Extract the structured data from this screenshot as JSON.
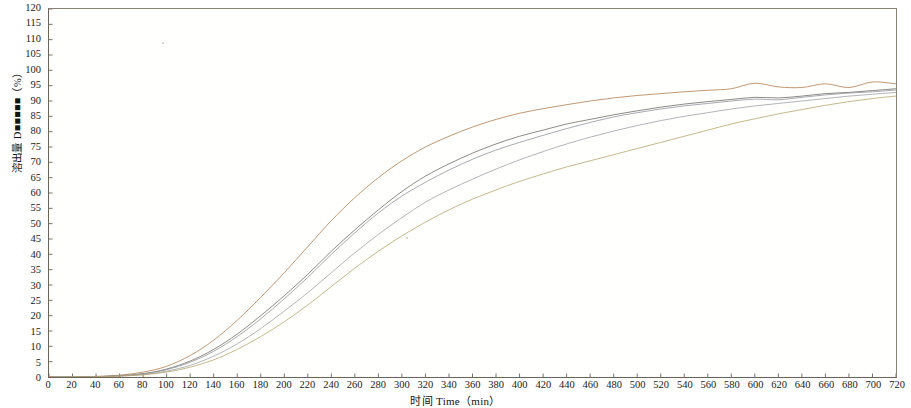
{
  "chart_data": {
    "type": "line",
    "title": "",
    "subtitle": "",
    "xlabel": "时间 Time（min）",
    "ylabel": "溶出量 D■■■■■（%）",
    "xlim": [
      0,
      720
    ],
    "ylim": [
      0,
      120
    ],
    "grid": false,
    "legend": "none",
    "xticks": [
      0,
      20,
      40,
      60,
      80,
      100,
      120,
      140,
      160,
      180,
      200,
      220,
      240,
      260,
      280,
      300,
      320,
      340,
      360,
      380,
      400,
      420,
      440,
      460,
      480,
      500,
      520,
      540,
      560,
      580,
      600,
      620,
      640,
      660,
      680,
      700,
      720
    ],
    "yticks": [
      0,
      5,
      10,
      15,
      20,
      25,
      30,
      35,
      40,
      45,
      50,
      55,
      60,
      65,
      70,
      75,
      80,
      85,
      90,
      95,
      100,
      105,
      110,
      115,
      120
    ],
    "x": [
      0,
      20,
      40,
      60,
      80,
      100,
      120,
      140,
      160,
      180,
      200,
      220,
      240,
      260,
      280,
      300,
      320,
      340,
      360,
      380,
      400,
      420,
      440,
      460,
      480,
      500,
      520,
      540,
      560,
      580,
      600,
      620,
      640,
      660,
      680,
      700,
      720
    ],
    "series": [
      {
        "name": "曲线 1",
        "color": "#b07a4a",
        "values": [
          0,
          0,
          0.2,
          0.6,
          1.6,
          3.5,
          7.0,
          12.0,
          18.5,
          26.0,
          34.0,
          42.5,
          51.0,
          58.5,
          65.0,
          70.5,
          75.0,
          78.5,
          81.5,
          84.0,
          86.0,
          87.5,
          88.8,
          90.0,
          91.0,
          91.8,
          92.4,
          93.0,
          93.5,
          94.0,
          95.8,
          94.6,
          94.4,
          95.6,
          94.4,
          96.2,
          95.6
        ]
      },
      {
        "name": "曲线 2",
        "color": "#6d6a63",
        "values": [
          0,
          0,
          0.1,
          0.4,
          1.1,
          2.6,
          5.2,
          9.0,
          14.0,
          20.0,
          26.5,
          33.5,
          41.0,
          48.0,
          54.5,
          60.5,
          65.5,
          69.5,
          73.0,
          76.0,
          78.5,
          80.5,
          82.5,
          84.0,
          85.5,
          86.8,
          88.0,
          89.0,
          89.8,
          90.5,
          91.2,
          91.0,
          91.6,
          92.4,
          92.8,
          93.4,
          94.0
        ]
      },
      {
        "name": "曲线 3",
        "color": "#8e9299",
        "values": [
          0,
          0,
          0.1,
          0.4,
          1.0,
          2.4,
          4.8,
          8.4,
          13.2,
          19.0,
          25.5,
          32.5,
          40.0,
          47.0,
          53.5,
          59.0,
          63.5,
          67.5,
          71.0,
          74.0,
          76.5,
          78.8,
          81.0,
          83.0,
          84.8,
          86.2,
          87.4,
          88.4,
          89.2,
          90.0,
          90.6,
          90.4,
          91.2,
          92.0,
          92.6,
          93.0,
          93.6
        ]
      },
      {
        "name": "曲线 4",
        "color": "#9aa0a3",
        "values": [
          0,
          0,
          0.1,
          0.3,
          0.8,
          1.9,
          3.8,
          6.8,
          10.8,
          15.8,
          21.5,
          27.5,
          34.0,
          40.5,
          46.5,
          52.0,
          57.0,
          61.0,
          64.5,
          67.8,
          70.8,
          73.5,
          76.0,
          78.2,
          80.2,
          82.0,
          83.6,
          85.0,
          86.2,
          87.4,
          88.4,
          89.2,
          90.0,
          90.8,
          91.6,
          92.2,
          92.8
        ]
      },
      {
        "name": "曲线 5",
        "color": "#b5a469",
        "values": [
          0,
          0,
          0.1,
          0.3,
          0.7,
          1.6,
          3.2,
          5.6,
          9.0,
          13.2,
          18.0,
          23.5,
          29.5,
          35.5,
          41.0,
          46.0,
          50.5,
          54.5,
          58.0,
          61.0,
          63.8,
          66.2,
          68.5,
          70.5,
          72.5,
          74.5,
          76.5,
          78.5,
          80.5,
          82.5,
          84.2,
          85.8,
          87.2,
          88.6,
          89.8,
          90.8,
          91.6
        ]
      }
    ]
  },
  "axes": {
    "y_title": "溶出量 D■■■■■（%）",
    "x_title": "时间 Time（min）"
  }
}
